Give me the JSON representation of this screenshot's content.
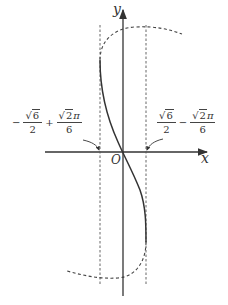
{
  "diagram": {
    "axes": {
      "x_label": "x",
      "y_label": "y",
      "origin_label": "O"
    },
    "left_annotation": {
      "sign": "−",
      "term1": {
        "num_radical": "6",
        "den": "2"
      },
      "op": "+",
      "term2": {
        "num_radical": "2",
        "num_suffix": "π",
        "den": "6"
      }
    },
    "right_annotation": {
      "term1": {
        "num_radical": "6",
        "den": "2"
      },
      "op": "−",
      "term2": {
        "num_radical": "2",
        "num_suffix": "π",
        "den": "6"
      }
    },
    "curve": {
      "solid_segment": "between asymptote lines",
      "dashed_segment": "outside vertical dashed lines"
    },
    "colors": {
      "line": "#333333",
      "background": "#ffffff"
    }
  }
}
